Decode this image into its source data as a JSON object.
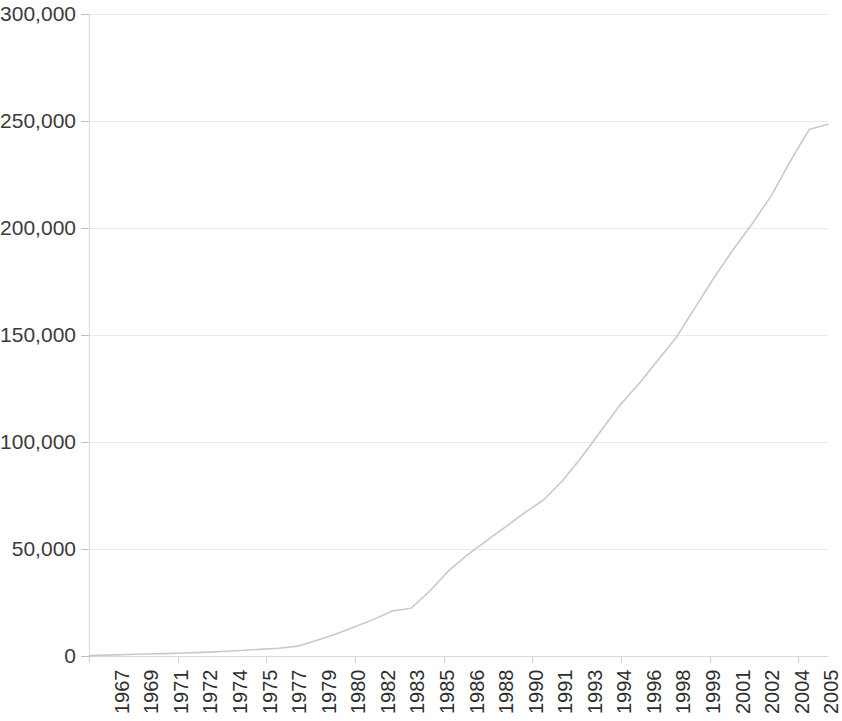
{
  "chart_data": {
    "type": "line",
    "title": "",
    "subtitle": "",
    "xlabel": "",
    "ylabel": "",
    "xlim": [
      1967,
      2006
    ],
    "ylim": [
      0,
      300000
    ],
    "grid": true,
    "legend": false,
    "legend_position": "none",
    "line_color": "#c9c9c9",
    "gridline_color": "#e9e9e9",
    "axis_color": "#d9d9d9",
    "tick_label_color": "#333333",
    "y_ticks": [
      0,
      50000,
      100000,
      150000,
      200000,
      250000,
      300000
    ],
    "y_tick_labels": [
      "0",
      "50,000",
      "100,000",
      "150,000",
      "200,000",
      "250,000",
      "300,000"
    ],
    "x_tick_labels": [
      "1967",
      "1969",
      "1971",
      "1972",
      "1974",
      "1975",
      "1977",
      "1979",
      "1980",
      "1982",
      "1983",
      "1985",
      "1986",
      "1988",
      "1990",
      "1991",
      "1993",
      "1994",
      "1996",
      "1998",
      "1999",
      "2001",
      "2002",
      "2004",
      "2005"
    ],
    "x": [
      1967,
      1968,
      1969,
      1970,
      1971,
      1972,
      1973,
      1974,
      1975,
      1976,
      1977,
      1978,
      1979,
      1980,
      1981,
      1982,
      1983,
      1984,
      1985,
      1986,
      1987,
      1988,
      1989,
      1990,
      1991,
      1992,
      1993,
      1994,
      1995,
      1996,
      1997,
      1998,
      1999,
      2000,
      2001,
      2002,
      2003,
      2004,
      2005,
      2006
    ],
    "values": [
      200,
      400,
      700,
      900,
      1100,
      1400,
      1700,
      2100,
      2600,
      3100,
      3600,
      4600,
      7200,
      10200,
      13500,
      17000,
      21000,
      22300,
      30500,
      40000,
      47500,
      54000,
      60500,
      67000,
      73000,
      82000,
      93000,
      105000,
      117000,
      127000,
      138000,
      149000,
      163000,
      177000,
      190000,
      202000,
      215000,
      231000,
      246000,
      248500
    ],
    "series": [
      {
        "name": "cumulative-total",
        "values": [
          200,
          400,
          700,
          900,
          1100,
          1400,
          1700,
          2100,
          2600,
          3100,
          3600,
          4600,
          7200,
          10200,
          13500,
          17000,
          21000,
          22300,
          30500,
          40000,
          47500,
          54000,
          60500,
          67000,
          73000,
          82000,
          93000,
          105000,
          117000,
          127000,
          138000,
          149000,
          163000,
          177000,
          190000,
          202000,
          215000,
          231000,
          246000,
          248500
        ]
      }
    ]
  }
}
